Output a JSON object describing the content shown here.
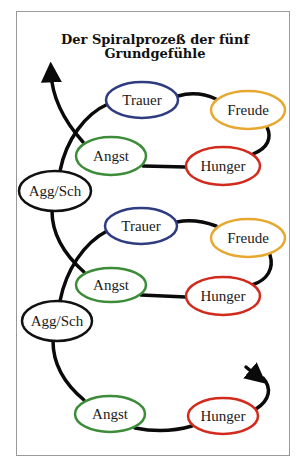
{
  "title": {
    "line1": "Der Spiralprozeß der fünf",
    "line2": "Grundgefühle"
  },
  "colors": {
    "trauer": "#2f3d80",
    "freude": "#e8a830",
    "hunger": "#d22a1c",
    "angst": "#3d8c3a",
    "agg_sch": "#111111",
    "line": "#0a0a0a"
  },
  "nodes": [
    {
      "id": "trauer-1",
      "label": "Trauer",
      "cx": 142,
      "cy": 100,
      "rx": 36,
      "ry": 18,
      "color": "#2f3d80"
    },
    {
      "id": "freude-1",
      "label": "Freude",
      "cx": 248,
      "cy": 110,
      "rx": 37,
      "ry": 19,
      "color": "#e8a830"
    },
    {
      "id": "angst-1",
      "label": "Angst",
      "cx": 111,
      "cy": 156,
      "rx": 35,
      "ry": 19,
      "color": "#3d8c3a"
    },
    {
      "id": "hunger-1",
      "label": "Hunger",
      "cx": 223,
      "cy": 166,
      "rx": 37,
      "ry": 19,
      "color": "#d22a1c"
    },
    {
      "id": "aggsch-1",
      "label": "Agg/Sch",
      "cx": 55,
      "cy": 191,
      "rx": 36,
      "ry": 20,
      "color": "#111111"
    },
    {
      "id": "trauer-2",
      "label": "Trauer",
      "cx": 141,
      "cy": 226,
      "rx": 36,
      "ry": 18,
      "color": "#2f3d80"
    },
    {
      "id": "freude-2",
      "label": "Freude",
      "cx": 248,
      "cy": 238,
      "rx": 37,
      "ry": 19,
      "color": "#e8a830"
    },
    {
      "id": "angst-2",
      "label": "Angst",
      "cx": 111,
      "cy": 285,
      "rx": 35,
      "ry": 17,
      "color": "#3d8c3a"
    },
    {
      "id": "hunger-2",
      "label": "Hunger",
      "cx": 223,
      "cy": 296,
      "rx": 37,
      "ry": 19,
      "color": "#d22a1c"
    },
    {
      "id": "aggsch-2",
      "label": "Agg/Sch",
      "cx": 57,
      "cy": 321,
      "rx": 35,
      "ry": 20,
      "color": "#111111"
    },
    {
      "id": "angst-3",
      "label": "Angst",
      "cx": 110,
      "cy": 414,
      "rx": 35,
      "ry": 18,
      "color": "#3d8c3a"
    },
    {
      "id": "hunger-3",
      "label": "Hunger",
      "cx": 223,
      "cy": 416,
      "rx": 35,
      "ry": 18,
      "color": "#d22a1c"
    }
  ]
}
